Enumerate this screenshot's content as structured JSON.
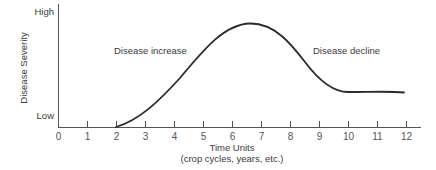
{
  "chart_data": {
    "type": "line",
    "title": "",
    "xlabel": "Time Units",
    "xlabel_sub": "(crop cycles, years, etc.)",
    "ylabel": "Disease Severity",
    "y_tick_labels": [
      "Low",
      "High"
    ],
    "x_ticks": [
      0,
      1,
      2,
      3,
      4,
      5,
      6,
      7,
      8,
      9,
      10,
      11,
      12
    ],
    "xlim": [
      0,
      12.5
    ],
    "ylim": [
      0,
      1
    ],
    "grid": false,
    "legend": null,
    "annotations": [
      {
        "text": "Disease increase",
        "x": 3.8,
        "y": 0.74
      },
      {
        "text": "Disease decline",
        "x": 9.9,
        "y": 0.74
      }
    ],
    "series": [
      {
        "name": "Disease severity",
        "x": [
          2,
          2.5,
          3,
          3.5,
          4,
          4.5,
          5,
          5.5,
          6,
          6.5,
          7,
          7.5,
          8,
          8.5,
          9,
          9.5,
          10,
          10.5,
          11,
          11.5,
          12
        ],
        "y": [
          0.0,
          0.05,
          0.12,
          0.22,
          0.35,
          0.5,
          0.65,
          0.77,
          0.84,
          0.86,
          0.85,
          0.8,
          0.7,
          0.56,
          0.43,
          0.35,
          0.32,
          0.31,
          0.31,
          0.31,
          0.3
        ]
      }
    ]
  },
  "labels": {
    "y_high": "High",
    "y_low": "Low",
    "y_axis": "Disease Severity",
    "x_axis": "Time Units",
    "x_axis_sub": "(crop cycles, years, etc.)",
    "increase": "Disease increase",
    "decline": "Disease decline",
    "ticks": [
      "0",
      "1",
      "2",
      "3",
      "4",
      "5",
      "6",
      "7",
      "8",
      "9",
      "10",
      "11",
      "12"
    ]
  }
}
